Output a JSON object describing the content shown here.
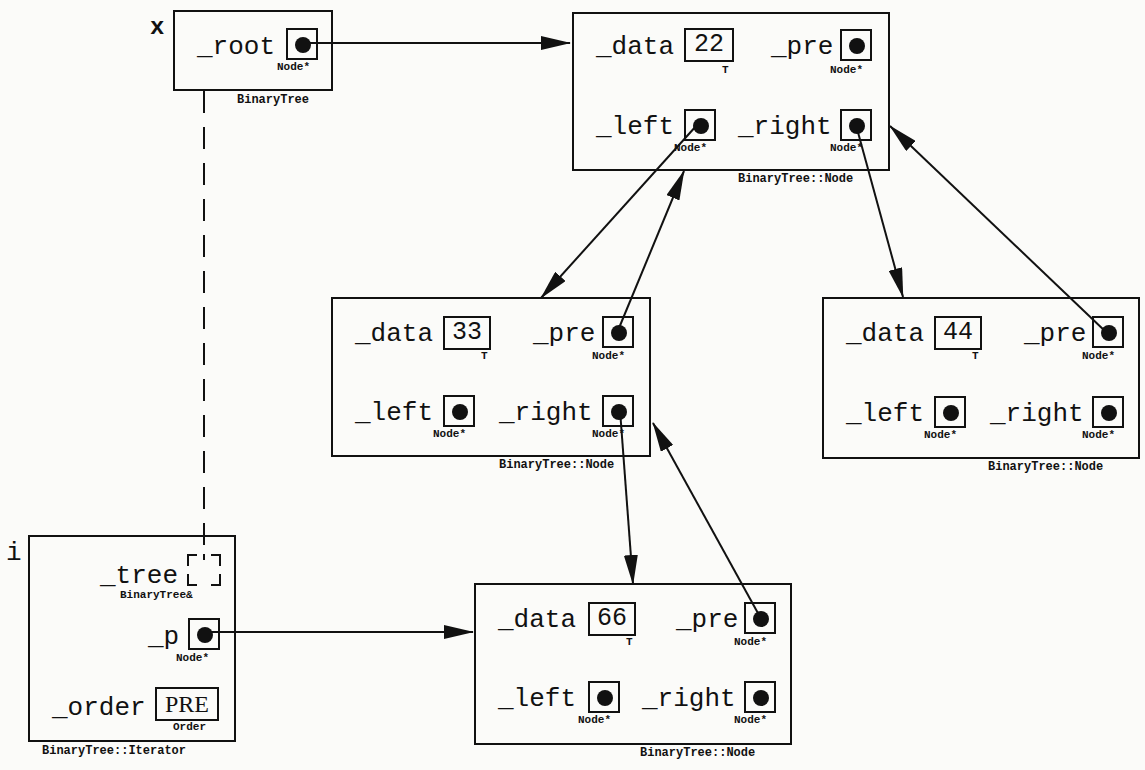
{
  "variables": {
    "x": {
      "name": "x",
      "type": "BinaryTree",
      "fields": {
        "root": {
          "label": "_root",
          "type": "Node*"
        }
      }
    },
    "i": {
      "name": "i",
      "type": "BinaryTree::Iterator",
      "fields": {
        "tree": {
          "label": "_tree",
          "type": "BinaryTree&"
        },
        "p": {
          "label": "_p",
          "type": "Node*"
        },
        "order": {
          "label": "_order",
          "value": "PRE",
          "type": "Order"
        }
      }
    }
  },
  "nodes": [
    {
      "id": "n22",
      "type": "BinaryTree::Node",
      "data_label": "_data",
      "data_value": "22",
      "data_type": "T",
      "pre_label": "_pre",
      "left_label": "_left",
      "right_label": "_right",
      "ptr_type": "Node*"
    },
    {
      "id": "n33",
      "type": "BinaryTree::Node",
      "data_label": "_data",
      "data_value": "33",
      "data_type": "T",
      "pre_label": "_pre",
      "left_label": "_left",
      "right_label": "_right",
      "ptr_type": "Node*"
    },
    {
      "id": "n44",
      "type": "BinaryTree::Node",
      "data_label": "_data",
      "data_value": "44",
      "data_type": "T",
      "pre_label": "_pre",
      "left_label": "_left",
      "right_label": "_right",
      "ptr_type": "Node*"
    },
    {
      "id": "n66",
      "type": "BinaryTree::Node",
      "data_label": "_data",
      "data_value": "66",
      "data_type": "T",
      "pre_label": "_pre",
      "left_label": "_left",
      "right_label": "_right",
      "ptr_type": "Node*"
    }
  ],
  "edges": [
    {
      "from": "x._root",
      "to": "n22"
    },
    {
      "from": "n22._left",
      "to": "n33"
    },
    {
      "from": "n22._right",
      "to": "n44"
    },
    {
      "from": "n33._pre",
      "to": "n22"
    },
    {
      "from": "n33._right",
      "to": "n66"
    },
    {
      "from": "n44._pre",
      "to": "n22"
    },
    {
      "from": "n66._pre",
      "to": "n33"
    },
    {
      "from": "i._p",
      "to": "n66"
    },
    {
      "from": "i._tree",
      "to": "x",
      "style": "dashed"
    }
  ]
}
